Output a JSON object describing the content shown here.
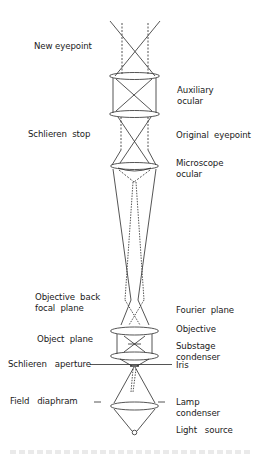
{
  "diagram": {
    "type": "schlieren-microscope-optical-path",
    "line_color": "#2a2a2a",
    "left_labels": [
      {
        "id": "new-eyepoint",
        "text": "New eyepoint",
        "x": 34,
        "y": 46
      },
      {
        "id": "schlieren-stop",
        "text": "Schlieren  stop",
        "x": 28,
        "y": 134
      },
      {
        "id": "objective-back-focal-plane",
        "text": "Objective  back\nfocal  plane",
        "x": 36,
        "y": 298
      },
      {
        "id": "object-plane",
        "text": "Object  plane",
        "x": 38,
        "y": 338
      },
      {
        "id": "schlieren-aperture",
        "text": "Schlieren   aperture",
        "x": 9,
        "y": 360
      },
      {
        "id": "field-diaphram",
        "text": "Field   diaphram",
        "x": 10,
        "y": 398
      }
    ],
    "right_labels": [
      {
        "id": "auxiliary-ocular",
        "text": "Auxiliary\nocular",
        "x": 177,
        "y": 85
      },
      {
        "id": "original-eyepoint",
        "text": "Original  eyepoint",
        "x": 176,
        "y": 134
      },
      {
        "id": "microscope-ocular",
        "text": "Microscope\nocular",
        "x": 176,
        "y": 157
      },
      {
        "id": "fourier-plane",
        "text": "Fourier  plane",
        "x": 176,
        "y": 308
      },
      {
        "id": "objective",
        "text": "Objective",
        "x": 176,
        "y": 326
      },
      {
        "id": "substage-condenser",
        "text": "Substage\ncondenser",
        "x": 176,
        "y": 343
      },
      {
        "id": "iris",
        "text": "Iris",
        "x": 176,
        "y": 365
      },
      {
        "id": "lamp-condenser",
        "text": "Lamp\ncondenser",
        "x": 176,
        "y": 398
      },
      {
        "id": "light-source",
        "text": "Light   source",
        "x": 176,
        "y": 426
      }
    ],
    "caption": ""
  }
}
